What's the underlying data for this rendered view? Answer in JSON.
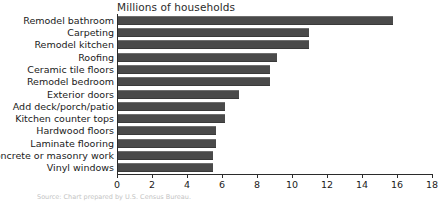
{
  "chart_data": {
    "type": "bar",
    "orientation": "horizontal",
    "title": "Millions of households",
    "xlabel": "",
    "ylabel": "",
    "xlim": [
      0,
      18
    ],
    "xticks": [
      0,
      2,
      4,
      6,
      8,
      10,
      12,
      14,
      16,
      18
    ],
    "grid": false,
    "legend": null,
    "bar_color": "#4a4a4a",
    "axis_color": "#2b2b2b",
    "categories": [
      "Remodel bathroom",
      "Carpeting",
      "Remodel kitchen",
      "Roofing",
      "Ceramic tile floors",
      "Remodel bedroom",
      "Exterior doors",
      "Add deck/porch/patio",
      "Kitchen counter tops",
      "Hardwood floors",
      "Laminate flooring",
      "Concrete or masonry work",
      "Vinyl windows"
    ],
    "values": [
      15.7,
      10.9,
      10.9,
      9.1,
      8.7,
      8.7,
      6.9,
      6.1,
      6.1,
      5.6,
      5.6,
      5.4,
      5.4
    ]
  },
  "source": {
    "text": "Source: Chart prepared by U.S. Census Bureau."
  }
}
